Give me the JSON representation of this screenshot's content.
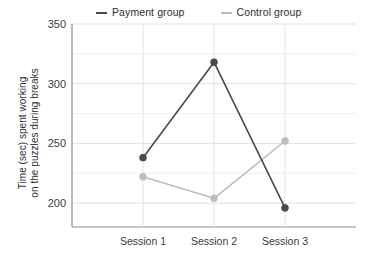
{
  "chart_data": {
    "type": "line",
    "title": "",
    "xlabel": "",
    "ylabel": "Time (sec) spent working on the puzzles during breaks",
    "ylabel_lines": [
      "Time (sec) spent working",
      "on the puzzles during breaks"
    ],
    "categories": [
      "Session 1",
      "Session 2",
      "Session 3"
    ],
    "series": [
      {
        "name": "Payment group",
        "values": [
          238,
          318,
          196
        ],
        "color": "#4a4a4a"
      },
      {
        "name": "Control group",
        "values": [
          222,
          204,
          252
        ],
        "color": "#bdbdbd"
      }
    ],
    "ylim": [
      180,
      350
    ],
    "yticks": [
      200,
      250,
      300,
      350
    ],
    "ytick_labels": [
      "200",
      "250",
      "300",
      "350"
    ],
    "minor_ytick_step": 25,
    "grid": true,
    "grid_color": "#e3e3e3",
    "legend_position": "top"
  },
  "legend": {
    "entries": [
      {
        "label": "Payment group",
        "marker": "line-swatch-dark"
      },
      {
        "label": "Control group",
        "marker": "line-swatch-light"
      }
    ]
  },
  "axes": {
    "y_title_line1": "Time (sec) spent working",
    "y_title_line2": "on the puzzles during breaks",
    "y_tick_350": "350",
    "y_tick_300": "300",
    "y_tick_250": "250",
    "y_tick_200": "200",
    "x_tick_1": "Session 1",
    "x_tick_2": "Session 2",
    "x_tick_3": "Session 3"
  },
  "colors": {
    "payment": "#4a4a4a",
    "control": "#bdbdbd",
    "grid": "#e3e3e3",
    "axis": "#9a9a9a",
    "background": "#ffffff"
  }
}
